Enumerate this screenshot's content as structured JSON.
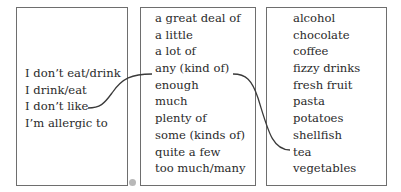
{
  "columns": [
    {
      "id": "subject-phrases",
      "items": [
        "I don’t eat/drink",
        "I drink/eat",
        "I don’t like",
        "I’m allergic to"
      ]
    },
    {
      "id": "quantifiers",
      "items": [
        "a great deal of",
        "a little",
        "a lot of",
        "any (kind of)",
        "enough",
        "much",
        "plenty of",
        "some (kinds of)",
        "quite a few",
        "too much/many"
      ]
    },
    {
      "id": "food-drink",
      "items": [
        "alcohol",
        "chocolate",
        "coffee",
        "fizzy drinks",
        "fresh fruit",
        "pasta",
        "potatoes",
        "shellfish",
        "tea",
        "vegetables"
      ]
    }
  ],
  "connections": [
    {
      "from": "I don’t like",
      "to": "any (kind of)"
    },
    {
      "from": "any (kind of)",
      "to": "tea"
    }
  ],
  "colors": {
    "border": "#6e6e6e",
    "line": "#3a3a3a",
    "text": "#2a2a2a"
  }
}
